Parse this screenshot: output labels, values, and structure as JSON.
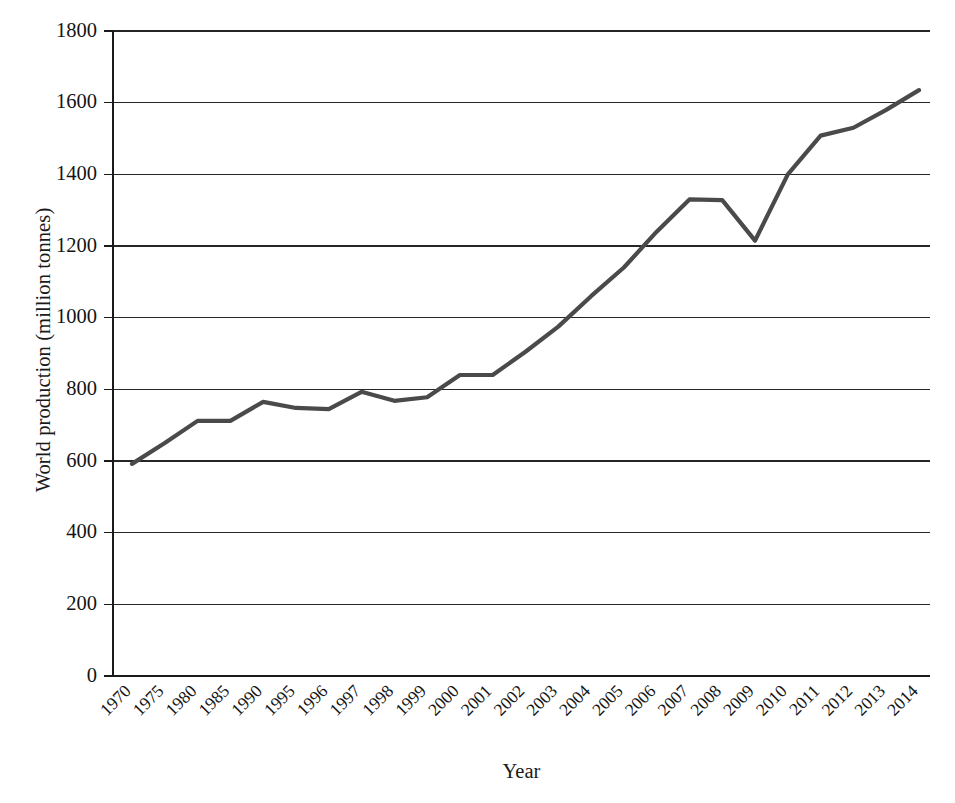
{
  "chart_data": {
    "type": "line",
    "title": "",
    "xlabel": "Year",
    "ylabel": "World production (million tonnes)",
    "categories": [
      "1970",
      "1975",
      "1980",
      "1985",
      "1990",
      "1995",
      "1996",
      "1997",
      "1998",
      "1999",
      "2000",
      "2001",
      "2002",
      "2003",
      "2004",
      "2005",
      "2006",
      "2007",
      "2008",
      "2009",
      "2010",
      "2011",
      "2012",
      "2013",
      "2014"
    ],
    "series": [
      {
        "name": "World production",
        "color": "#4a4a4a",
        "values": [
          592,
          650,
          712,
          712,
          765,
          748,
          745,
          793,
          768,
          778,
          840,
          840,
          905,
          975,
          1060,
          1140,
          1240,
          1330,
          1328,
          1215,
          1400,
          1508,
          1530,
          1580,
          1635
        ]
      }
    ],
    "ylim": [
      0,
      1800
    ],
    "yticks": [
      0,
      200,
      400,
      600,
      800,
      1000,
      1200,
      1400,
      1600,
      1800
    ],
    "ytick_labels": [
      "0",
      "200",
      "400",
      "600",
      "800",
      "1000",
      "1200",
      "1400",
      "1600",
      "1800"
    ],
    "grid": "horizontal",
    "legend": "none",
    "background": "#ffffff",
    "axis_color": "#1a1a1a"
  }
}
